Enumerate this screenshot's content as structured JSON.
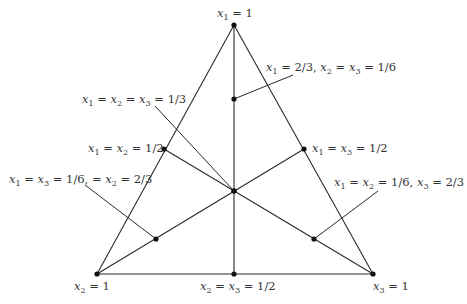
{
  "diagram": {
    "type": "ternary-simplex",
    "colors": {
      "line": "#2a2a2a",
      "point": "#111111",
      "text": "#333333",
      "background": "#ffffff"
    },
    "vertices": [
      {
        "id": "top",
        "x": 234,
        "y": 25,
        "label": "x1 = 1"
      },
      {
        "id": "bottom-left",
        "x": 97,
        "y": 274,
        "label": "x2 = 1"
      },
      {
        "id": "bottom-right",
        "x": 373,
        "y": 274,
        "label": "x3 = 1"
      }
    ],
    "points": [
      {
        "id": "left-mid",
        "x": 164,
        "y": 149,
        "label": "x1 = x2 = 1/2"
      },
      {
        "id": "right-mid",
        "x": 304,
        "y": 149,
        "label": "x1 = x3 = 1/2"
      },
      {
        "id": "bottom-mid",
        "x": 234,
        "y": 274,
        "label": "x2 = x3 = 1/2"
      },
      {
        "id": "centroid",
        "x": 234,
        "y": 191,
        "label": "x1 = x2 = x3 = 1/3"
      },
      {
        "id": "upper",
        "x": 234,
        "y": 99,
        "label": "x1 = 2/3, x2 = x3 = 1/6"
      },
      {
        "id": "lower-left",
        "x": 156,
        "y": 239,
        "label": "x1 = x3 = 1/6, = x2 = 2/3"
      },
      {
        "id": "lower-right",
        "x": 314,
        "y": 239,
        "label": "x1 = x2 = 1/6, x3 = 2/3"
      }
    ]
  }
}
